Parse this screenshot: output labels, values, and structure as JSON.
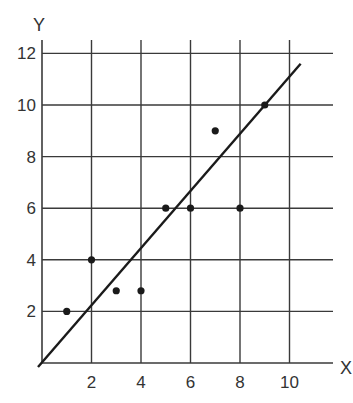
{
  "chart_data": {
    "type": "scatter",
    "title": "",
    "xlabel": "X",
    "ylabel": "Y",
    "xlim": [
      0,
      11
    ],
    "ylim": [
      0,
      12
    ],
    "grid": true,
    "x_ticks": [
      2,
      4,
      6,
      8,
      10
    ],
    "y_ticks": [
      2,
      4,
      6,
      8,
      10,
      12
    ],
    "x_tick_labels": [
      "2",
      "4",
      "6",
      "8",
      "10"
    ],
    "y_tick_labels": [
      "2",
      "4",
      "6",
      "8",
      "10",
      "12"
    ],
    "series": [
      {
        "name": "data points",
        "type": "scatter",
        "points": [
          {
            "x": 1,
            "y": 2
          },
          {
            "x": 2,
            "y": 4
          },
          {
            "x": 3,
            "y": 2.8
          },
          {
            "x": 4,
            "y": 2.8
          },
          {
            "x": 5,
            "y": 6
          },
          {
            "x": 6,
            "y": 6
          },
          {
            "x": 7,
            "y": 9
          },
          {
            "x": 8,
            "y": 6
          },
          {
            "x": 9,
            "y": 10
          }
        ]
      },
      {
        "name": "best-fit line",
        "type": "line",
        "points": [
          {
            "x": 0,
            "y": 0
          },
          {
            "x": 10.45,
            "y": 11.6
          }
        ]
      }
    ],
    "legend": null
  },
  "colors": {
    "grid": "#3a3a3a",
    "points": "#1a1a1a",
    "line": "#1a1a1a",
    "text": "#333333"
  }
}
